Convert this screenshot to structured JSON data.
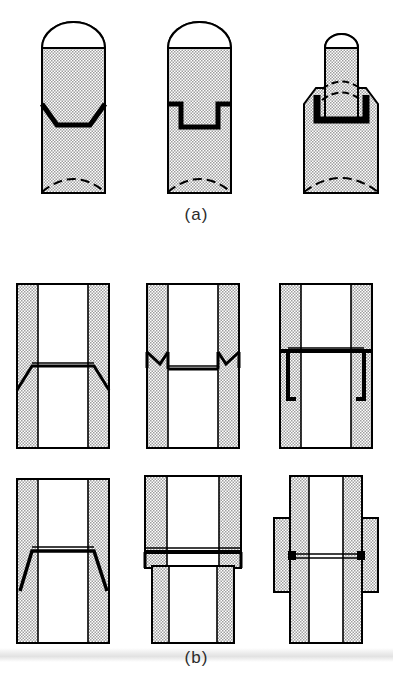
{
  "figure": {
    "background_color": "#ffffff",
    "line_color": "#000000",
    "hatch_fill_color": "#d6d6d6",
    "weld_bead_color": "#000000",
    "width": 393,
    "height": 691
  },
  "panels": [
    {
      "id": "a",
      "label": "(a)",
      "caption_position": "below",
      "view": "external-elevation",
      "items": [
        {
          "name": "single-bevel-chamfer-joint",
          "description": "Domed-top cylinder with inward tapered (trapezoidal) circumferential weld joint",
          "top": "dome",
          "joint_profile": "chamfered-trapezoid",
          "hidden_line": "dashed-arc-bottom"
        },
        {
          "name": "stepped-rebate-joint",
          "description": "Domed-top cylinder with rectangular stepped (rebate) circumferential weld joint",
          "top": "dome",
          "joint_profile": "rectangular-step",
          "hidden_line": "dashed-arc-bottom"
        },
        {
          "name": "spigot-socket-plug-joint",
          "description": "Narrow domed plug inserted into wider cylinder body, socket weld",
          "top": "dome",
          "joint_profile": "plug-in-socket",
          "hidden_line": "dashed-arcs-top-and-bottom"
        }
      ]
    },
    {
      "id": "b",
      "label": "(b)",
      "caption_position": "below",
      "view": "sectional-cutaway",
      "rows": [
        {
          "row": 1,
          "items": [
            {
              "name": "single-bevel-butt-weld-section",
              "description": "Tube wall section with outward flaring bevel at weld line"
            },
            {
              "name": "double-v-groove-weld-section",
              "description": "Tube wall section with V notch grooves opening outward at weld line"
            },
            {
              "name": "stepped-socket-weld-section",
              "description": "Tube wall section with rectangular stepped socket at weld line"
            }
          ]
        },
        {
          "row": 2,
          "items": [
            {
              "name": "inward-bevel-weld-section",
              "description": "Tube wall section with inward flaring bevel at weld line"
            },
            {
              "name": "offset-diameter-lap-weld-section",
              "description": "Upper tube of larger diameter lapped over lower tube at weld line"
            },
            {
              "name": "external-sleeve-collar-weld-section",
              "description": "Butt weld reinforced by external sleeve collar across joint"
            }
          ]
        }
      ]
    }
  ]
}
